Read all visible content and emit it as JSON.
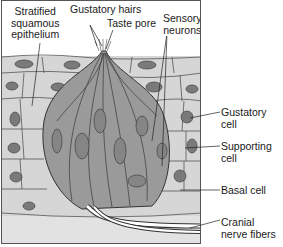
{
  "figure": {
    "colors": {
      "epithelium_fill": "#d6d6d6",
      "taste_bud_fill": "#9a9a9a",
      "nucleus_fill": "#7a7a7a",
      "outline": "#333333",
      "connective_tissue": "#e2e2e2",
      "nerve_fiber": "#ffffff"
    },
    "labels": {
      "stratified": [
        "Stratified",
        "squamous",
        "epithelium"
      ],
      "gustatory_hairs": "Gustatory hairs",
      "taste_pore": "Taste pore",
      "sensory_neurons": [
        "Sensory",
        "neurons"
      ],
      "gustatory_cell": [
        "Gustatory",
        "cell"
      ],
      "supporting_cell": [
        "Supporting",
        "cell"
      ],
      "basal_cell": "Basal cell",
      "cranial_nerve": [
        "Cranial",
        "nerve fibers"
      ]
    }
  }
}
